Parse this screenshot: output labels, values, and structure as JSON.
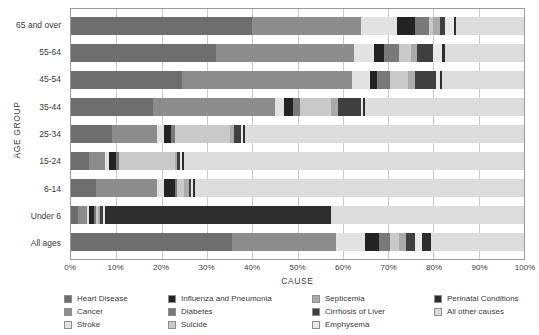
{
  "chart_data": {
    "type": "bar",
    "subtype": "stacked-horizontal-100-percent",
    "title": "",
    "xlabel": "CAUSE",
    "ylabel": "AGE GROUP",
    "xlim": [
      0,
      100
    ],
    "xticks": [
      "0%",
      "10%",
      "20%",
      "30%",
      "40%",
      "50%",
      "60%",
      "70%",
      "80%",
      "90%",
      "100%"
    ],
    "xtick_values": [
      0,
      10,
      20,
      30,
      40,
      50,
      60,
      70,
      80,
      90,
      100
    ],
    "grid": true,
    "grid_axis": "x",
    "legend_position": "bottom",
    "legend_columns": 4,
    "categories": [
      "65 and over",
      "55-64",
      "45-54",
      "35-44",
      "25-34",
      "15-24",
      "6-14",
      "Under 6",
      "All ages"
    ],
    "series": [
      {
        "name": "Heart Disease",
        "color": "#6e6e6e",
        "values": [
          40.0,
          32.0,
          24.5,
          18.0,
          9.0,
          4.0,
          5.5,
          1.5,
          35.5
        ]
      },
      {
        "name": "Cancer",
        "color": "#8c8c8c",
        "values": [
          24.0,
          30.5,
          37.5,
          27.0,
          10.0,
          3.5,
          13.5,
          2.0,
          23.0
        ]
      },
      {
        "name": "Stroke",
        "color": "#e2e2e2",
        "values": [
          8.0,
          4.5,
          4.0,
          2.0,
          1.5,
          1.0,
          1.5,
          0.5,
          6.5
        ]
      },
      {
        "name": "Influenza and Pneumonia",
        "color": "#232323",
        "values": [
          4.0,
          2.0,
          1.5,
          2.0,
          1.5,
          1.5,
          2.5,
          1.0,
          3.0
        ]
      },
      {
        "name": "Diabetes",
        "color": "#797979",
        "values": [
          3.0,
          3.5,
          3.0,
          1.5,
          1.0,
          0.5,
          0.5,
          0.5,
          2.5
        ]
      },
      {
        "name": "Suicide",
        "color": "#c9c9c9",
        "values": [
          1.0,
          2.5,
          4.0,
          7.0,
          12.0,
          12.5,
          1.5,
          0.5,
          2.0
        ]
      },
      {
        "name": "Septicemia",
        "color": "#aaaaaa",
        "values": [
          1.5,
          1.5,
          1.5,
          1.5,
          1.0,
          0.5,
          1.0,
          0.5,
          1.5
        ]
      },
      {
        "name": "Cirrhosis of Liver",
        "color": "#3f3f3f",
        "values": [
          1.0,
          3.5,
          4.5,
          5.0,
          1.5,
          0.5,
          0.5,
          0.5,
          2.0
        ]
      },
      {
        "name": "Emphysema",
        "color": "#e9e9e9",
        "values": [
          2.0,
          2.0,
          1.0,
          0.5,
          0.5,
          0.5,
          0.5,
          0.5,
          1.5
        ]
      },
      {
        "name": "Perinatal Conditions",
        "color": "#2d2d2d",
        "values": [
          0.5,
          0.5,
          0.5,
          0.5,
          0.5,
          0.5,
          0.5,
          50.0,
          2.0
        ]
      },
      {
        "name": "All other causes",
        "color": "#dcdcdc",
        "values": [
          15.0,
          17.5,
          18.0,
          35.0,
          61.5,
          75.0,
          72.5,
          42.5,
          20.5
        ]
      }
    ]
  },
  "axes": {
    "x_title": "CAUSE",
    "y_title": "AGE GROUP"
  },
  "legend": {
    "columns": [
      [
        {
          "label": "Heart Disease",
          "color": "#6e6e6e"
        },
        {
          "label": "Cancer",
          "color": "#8c8c8c"
        },
        {
          "label": "Stroke",
          "color": "#e2e2e2"
        }
      ],
      [
        {
          "label": "Influenza and Pneumonia",
          "color": "#232323"
        },
        {
          "label": "Diabetes",
          "color": "#797979"
        },
        {
          "label": "Suicide",
          "color": "#c9c9c9"
        }
      ],
      [
        {
          "label": "Septicemia",
          "color": "#aaaaaa"
        },
        {
          "label": "Cirrhosis of Liver",
          "color": "#3f3f3f"
        },
        {
          "label": "Emphysema",
          "color": "#e9e9e9"
        }
      ],
      [
        {
          "label": "Perinatal Conditions",
          "color": "#2d2d2d"
        },
        {
          "label": "All other causes",
          "color": "#dcdcdc"
        }
      ]
    ]
  },
  "colors": {
    "axis_line": "#9a9a9a",
    "gridline": "#c9c9c9",
    "text": "#3a3a3a",
    "background": "#ffffff"
  }
}
